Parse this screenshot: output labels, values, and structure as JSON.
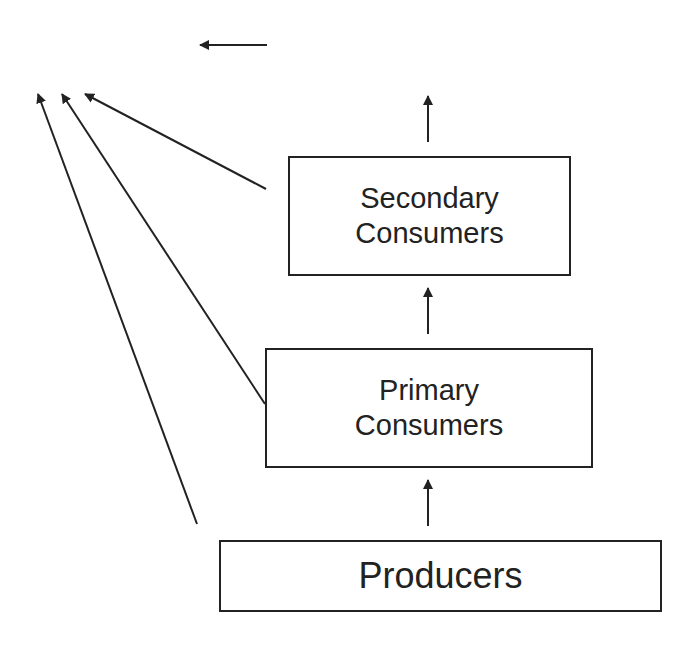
{
  "diagram": {
    "type": "energy-flow / trophic levels",
    "boxes": [
      {
        "id": "secondary",
        "lines": [
          "Secondary",
          "Consumers"
        ]
      },
      {
        "id": "primary",
        "lines": [
          "Primary",
          "Consumers"
        ]
      },
      {
        "id": "producers",
        "lines": [
          "Producers"
        ]
      }
    ],
    "arrows": [
      {
        "from": "producers",
        "to": "primary",
        "direction": "up"
      },
      {
        "from": "primary",
        "to": "secondary",
        "direction": "up"
      },
      {
        "from": "secondary",
        "to": "above",
        "direction": "up"
      },
      {
        "from": "secondary",
        "to": "heat-loss",
        "direction": "up-left"
      },
      {
        "from": "primary",
        "to": "heat-loss",
        "direction": "up-left"
      },
      {
        "from": "producers",
        "to": "heat-loss",
        "direction": "up-left"
      },
      {
        "from": "legend",
        "to": "left",
        "direction": "left"
      }
    ],
    "stroke_color": "#222222"
  }
}
